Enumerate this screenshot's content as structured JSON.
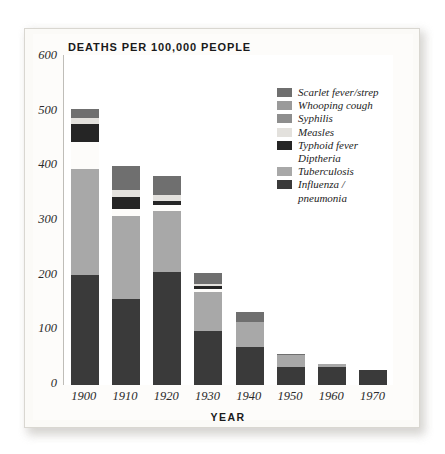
{
  "chart_data": {
    "type": "bar",
    "subtype": "stacked-bar",
    "title": "DEATHS PER 100,000 PEOPLE",
    "xlabel": "YEAR",
    "ylabel": "",
    "categories": [
      "1900",
      "1910",
      "1920",
      "1930",
      "1940",
      "1950",
      "1960",
      "1970"
    ],
    "ylim": [
      0,
      600
    ],
    "yticks": [
      600,
      500,
      400,
      300,
      200,
      100,
      0
    ],
    "xticks": [
      "1900",
      "1910",
      "1920",
      "1930",
      "1940",
      "1950",
      "1960",
      "1970"
    ],
    "grid": false,
    "legend_position": "upper-right",
    "series": [
      {
        "name": "Influenza / pneumonia",
        "color": "#3a3a3a",
        "values": [
          202,
          158,
          207,
          99,
          69,
          33,
          33,
          28
        ]
      },
      {
        "name": "Tuberculosis",
        "color": "#a8a8a8",
        "values": [
          194,
          152,
          111,
          72,
          46,
          21,
          5,
          0
        ]
      },
      {
        "name": "Diptheria",
        "color": "#fdfcfa",
        "values": [
          49,
          0,
          0,
          0,
          0,
          0,
          0,
          0
        ]
      },
      {
        "name": "Typhoid fever",
        "color": "#252525",
        "values": [
          32,
          22,
          6,
          5,
          0,
          0,
          0,
          0
        ]
      },
      {
        "name": "Measles",
        "color": "#e3e1dd",
        "values": [
          12,
          12,
          12,
          4,
          0,
          0,
          0,
          0
        ]
      },
      {
        "name": "Syphilis",
        "color": "#8e8e8e",
        "values": [
          0,
          0,
          0,
          0,
          0,
          0,
          0,
          0
        ]
      },
      {
        "name": "Whooping cough",
        "color": "#9a9a9a",
        "values": [
          0,
          0,
          0,
          0,
          0,
          0,
          0,
          0
        ]
      },
      {
        "name": "Scarlet fever/strep",
        "color": "#6f6f6f",
        "values": [
          16,
          56,
          47,
          25,
          18,
          3,
          0,
          0
        ]
      }
    ],
    "totals": [
      505,
      400,
      383,
      205,
      133,
      57,
      38,
      28
    ],
    "bars": [
      {
        "year": "1900",
        "total": 505,
        "segments": [
          {
            "label": "Influenza / pneumonia",
            "color": "#3a3a3a",
            "start": 0,
            "end": 202
          },
          {
            "label": "Tuberculosis",
            "color": "#a8a8a8",
            "start": 202,
            "end": 396
          },
          {
            "label": "Diptheria",
            "color": "#fdfcfa",
            "start": 396,
            "end": 445
          },
          {
            "label": "Typhoid fever",
            "color": "#252525",
            "start": 445,
            "end": 477
          },
          {
            "label": "Measles",
            "color": "#e3e1dd",
            "start": 477,
            "end": 489
          },
          {
            "label": "Scarlet fever/strep",
            "color": "#6f6f6f",
            "start": 489,
            "end": 505
          }
        ]
      },
      {
        "year": "1910",
        "total": 400,
        "segments": [
          {
            "label": "Influenza / pneumonia",
            "color": "#3a3a3a",
            "start": 0,
            "end": 158
          },
          {
            "label": "Tuberculosis",
            "color": "#a8a8a8",
            "start": 158,
            "end": 310
          },
          {
            "label": "Diptheria",
            "color": "#fdfcfa",
            "start": 310,
            "end": 322
          },
          {
            "label": "Typhoid fever",
            "color": "#252525",
            "start": 322,
            "end": 344
          },
          {
            "label": "Measles",
            "color": "#e3e1dd",
            "start": 344,
            "end": 356
          },
          {
            "label": "Scarlet fever/strep",
            "color": "#6f6f6f",
            "start": 356,
            "end": 400
          }
        ]
      },
      {
        "year": "1920",
        "total": 383,
        "segments": [
          {
            "label": "Influenza / pneumonia",
            "color": "#3a3a3a",
            "start": 0,
            "end": 207
          },
          {
            "label": "Tuberculosis",
            "color": "#a8a8a8",
            "start": 207,
            "end": 318
          },
          {
            "label": "Diptheria",
            "color": "#fdfcfa",
            "start": 318,
            "end": 330
          },
          {
            "label": "Typhoid fever",
            "color": "#252525",
            "start": 330,
            "end": 336
          },
          {
            "label": "Measles",
            "color": "#e3e1dd",
            "start": 336,
            "end": 348
          },
          {
            "label": "Scarlet fever/strep",
            "color": "#6f6f6f",
            "start": 348,
            "end": 383
          }
        ]
      },
      {
        "year": "1930",
        "total": 205,
        "segments": [
          {
            "label": "Influenza / pneumonia",
            "color": "#3a3a3a",
            "start": 0,
            "end": 99
          },
          {
            "label": "Tuberculosis",
            "color": "#a8a8a8",
            "start": 99,
            "end": 171
          },
          {
            "label": "Diptheria",
            "color": "#fdfcfa",
            "start": 171,
            "end": 176
          },
          {
            "label": "Typhoid fever",
            "color": "#252525",
            "start": 176,
            "end": 181
          },
          {
            "label": "Measles",
            "color": "#e3e1dd",
            "start": 181,
            "end": 185
          },
          {
            "label": "Scarlet fever/strep",
            "color": "#6f6f6f",
            "start": 185,
            "end": 205
          }
        ]
      },
      {
        "year": "1940",
        "total": 133,
        "segments": [
          {
            "label": "Influenza / pneumonia",
            "color": "#3a3a3a",
            "start": 0,
            "end": 69
          },
          {
            "label": "Tuberculosis",
            "color": "#a8a8a8",
            "start": 69,
            "end": 115
          },
          {
            "label": "Scarlet fever/strep",
            "color": "#6f6f6f",
            "start": 115,
            "end": 133
          }
        ]
      },
      {
        "year": "1950",
        "total": 57,
        "segments": [
          {
            "label": "Influenza / pneumonia",
            "color": "#3a3a3a",
            "start": 0,
            "end": 33
          },
          {
            "label": "Tuberculosis",
            "color": "#a8a8a8",
            "start": 33,
            "end": 54
          },
          {
            "label": "Scarlet fever/strep",
            "color": "#6f6f6f",
            "start": 54,
            "end": 57
          }
        ]
      },
      {
        "year": "1960",
        "total": 38,
        "segments": [
          {
            "label": "Influenza / pneumonia",
            "color": "#3a3a3a",
            "start": 0,
            "end": 33
          },
          {
            "label": "Tuberculosis",
            "color": "#a8a8a8",
            "start": 33,
            "end": 38
          }
        ]
      },
      {
        "year": "1970",
        "total": 28,
        "segments": [
          {
            "label": "Influenza / pneumonia",
            "color": "#3a3a3a",
            "start": 0,
            "end": 28
          }
        ]
      }
    ],
    "legend": [
      {
        "label": "Scarlet fever/strep",
        "color": "#6f6f6f",
        "swatch": true
      },
      {
        "label": "Whooping cough",
        "color": "#9a9a9a",
        "swatch": true
      },
      {
        "label": "Syphilis",
        "color": "#8e8e8e",
        "swatch": true
      },
      {
        "label": "Measles",
        "color": "#e3e1dd",
        "swatch": true
      },
      {
        "label": "Typhoid fever",
        "color": "#252525",
        "swatch": true
      },
      {
        "label": "Diptheria",
        "color": "#fdfcfa",
        "swatch": false
      },
      {
        "label": "Tuberculosis",
        "color": "#a8a8a8",
        "swatch": true
      },
      {
        "label": "Influenza /",
        "color": "#3a3a3a",
        "swatch": true
      },
      {
        "label": "pneumonia",
        "color": "#3a3a3a",
        "swatch": false
      }
    ]
  }
}
